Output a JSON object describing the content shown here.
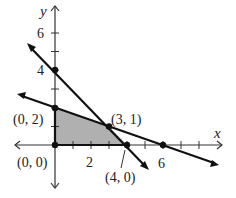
{
  "axes": {
    "x_label": "x",
    "y_label": "y",
    "x_ticks": [
      1,
      2,
      3,
      4,
      5,
      6,
      7,
      8
    ],
    "y_ticks": [
      1,
      2,
      3,
      4,
      5,
      6
    ],
    "x_tick_labels": {
      "2": "2",
      "6": "6"
    },
    "y_tick_labels": {
      "2": "2",
      "4": "4",
      "6": "6"
    },
    "y_tick_label_4": "4",
    "y_tick_label_6": "6",
    "x_tick_label_2": "2",
    "x_tick_label_6": "6"
  },
  "lines": [
    {
      "name": "line-1",
      "equation": "4x + 3y = 12",
      "points": [
        [
          0,
          4
        ],
        [
          3,
          1
        ],
        [
          4,
          0
        ]
      ]
    },
    {
      "name": "line-2",
      "equation": "x + 3y = 6",
      "points": [
        [
          0,
          2
        ],
        [
          3,
          1
        ],
        [
          6,
          0
        ]
      ]
    }
  ],
  "feasible_region": {
    "vertices": [
      [
        0,
        0
      ],
      [
        0,
        2
      ],
      [
        3,
        1
      ],
      [
        4,
        0
      ]
    ],
    "fill_color": "#b0b0b0"
  },
  "vertex_labels": {
    "v00": "(0, 0)",
    "v02": "(0, 2)",
    "v31": "(3, 1)",
    "v40": "(4, 0)"
  },
  "colors": {
    "line": "#111111",
    "axis": "#333333",
    "shade": "#b0b0b0"
  }
}
